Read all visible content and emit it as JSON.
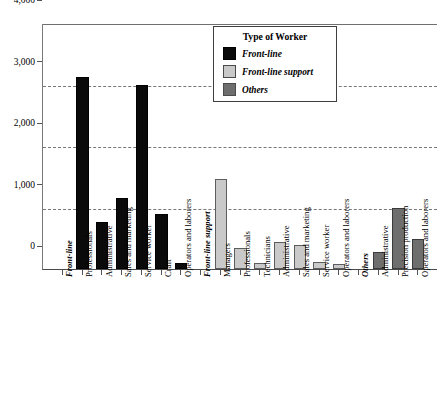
{
  "chart_data": {
    "type": "bar",
    "title": "",
    "xlabel": "",
    "ylabel": "",
    "ylim": [
      0,
      4000
    ],
    "grid": true,
    "legend_position": "top-center",
    "y_ticks": [
      "0",
      "1,000",
      "2,000",
      "3,000",
      "4,000"
    ],
    "y_tick_values": [
      0,
      1000,
      2000,
      3000,
      4000
    ],
    "legend": {
      "title": "Type of Worker",
      "entries": [
        {
          "label": "Front-line",
          "color": "#0a0a0a",
          "key": "frontline"
        },
        {
          "label": "Front-line support",
          "color": "#c9c9c9",
          "key": "frontsupport"
        },
        {
          "label": "Others",
          "color": "#6e6e6e",
          "key": "others"
        }
      ]
    },
    "groups": [
      {
        "name": "Front-line",
        "series_key": "frontline",
        "categories": [
          "Professionals",
          "Administrative",
          "Sales and marketing",
          "Service worker",
          "Craft",
          "Operators and laborers"
        ],
        "values": [
          3120,
          760,
          1160,
          3000,
          890,
          90
        ]
      },
      {
        "name": "Front-line support",
        "series_key": "frontsupport",
        "categories": [
          "Managers",
          "Professionals",
          "Technicians",
          "Administrative",
          "Sales and marketing",
          "Service worker",
          "Operators and laborers"
        ],
        "values": [
          1460,
          340,
          100,
          440,
          390,
          110,
          80
        ]
      },
      {
        "name": "Others",
        "series_key": "others",
        "categories": [
          "Administrative",
          "Precision production",
          "Operators and laborers"
        ],
        "values": [
          270,
          1000,
          480
        ]
      }
    ]
  },
  "source_note": ""
}
